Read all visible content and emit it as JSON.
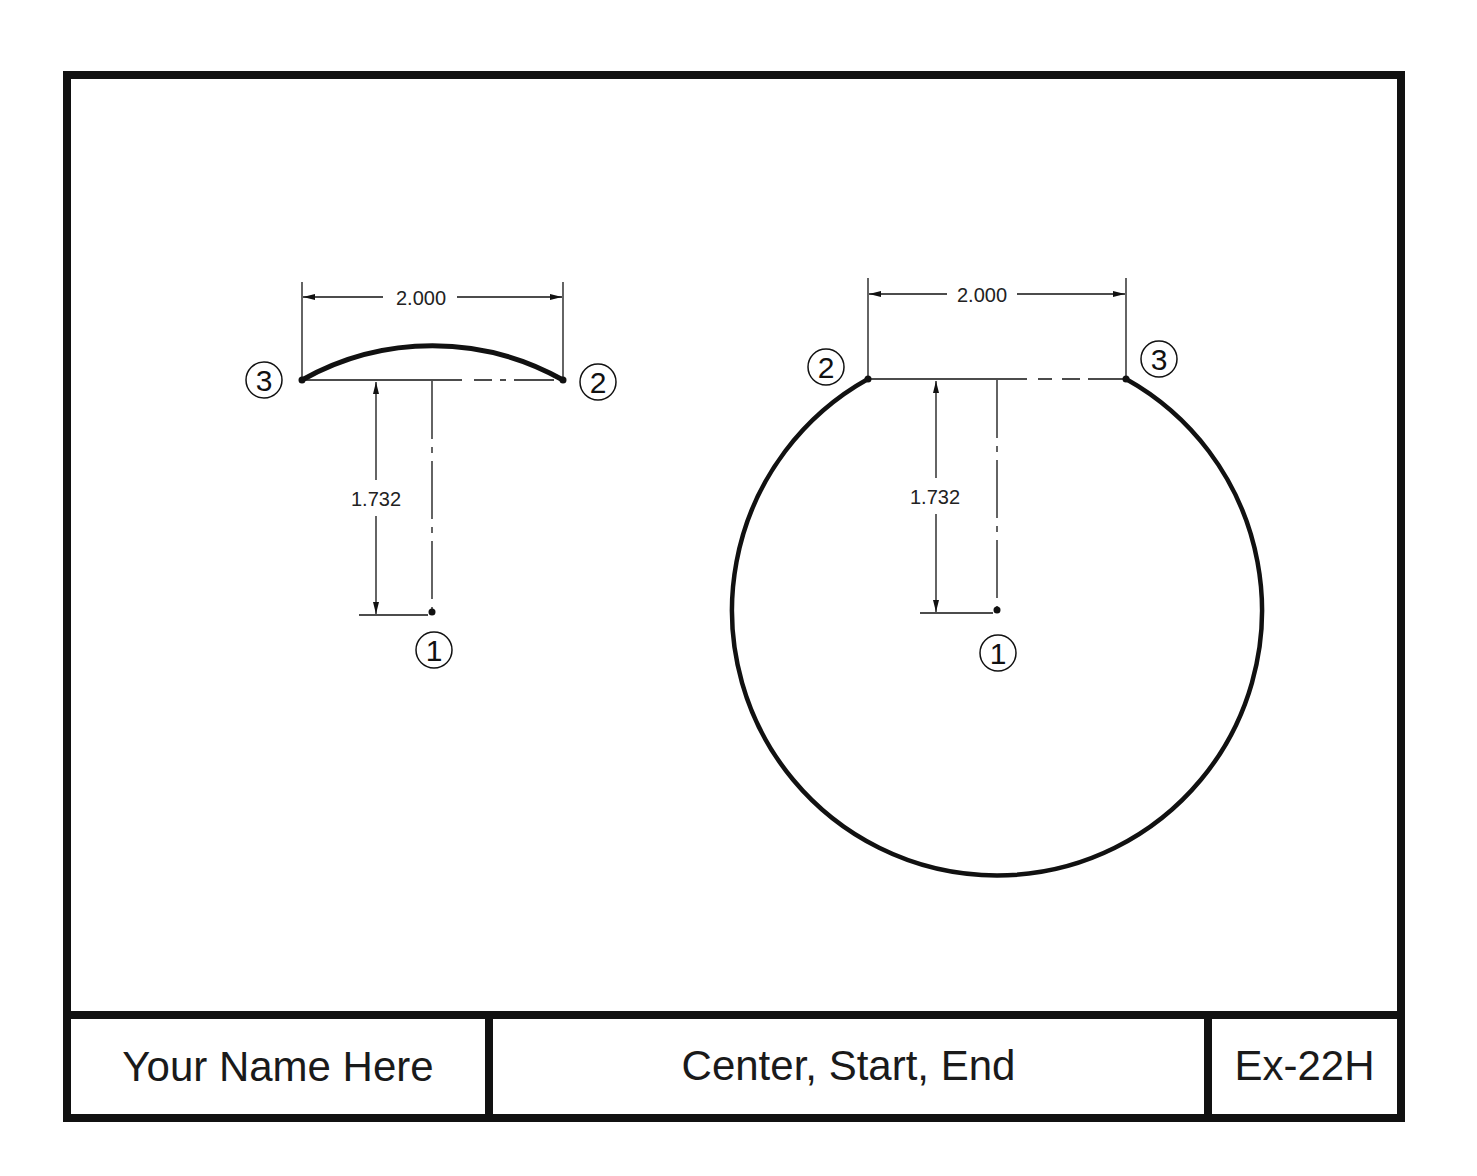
{
  "drawing": {
    "left_figure": {
      "width_dim": "2.000",
      "height_dim": "1.732",
      "labels": {
        "center": "①",
        "start": "②",
        "end": "③"
      }
    },
    "right_figure": {
      "width_dim": "2.000",
      "height_dim": "1.732",
      "labels": {
        "center": "①",
        "start": "②",
        "end": "③"
      }
    }
  },
  "title_block": {
    "name": "Your Name Here",
    "title": "Center, Start, End",
    "number": "Ex-22H"
  },
  "colors": {
    "line": "#111111",
    "background": "#ffffff"
  }
}
